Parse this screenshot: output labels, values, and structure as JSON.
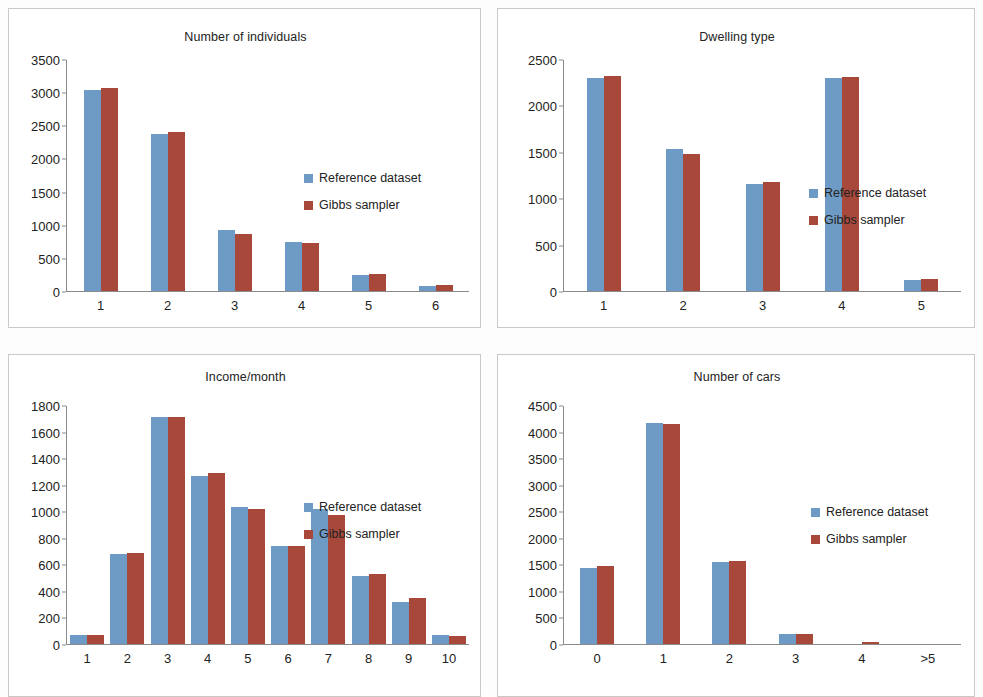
{
  "legend": {
    "series_a": "Reference dataset",
    "series_b": "Gibbs sampler"
  },
  "colors": {
    "series_a": "#6e9bc5",
    "series_b": "#a8483b",
    "axis": "#8a8a8a",
    "frame": "#c9c9c9",
    "text": "#222222",
    "background": "#ffffff"
  },
  "panels": [
    {
      "id": "number-of-individuals",
      "title": "Number of individuals"
    },
    {
      "id": "dwelling-type",
      "title": "Dwelling type"
    },
    {
      "id": "income-per-month",
      "title": "Income/month"
    },
    {
      "id": "number-of-cars",
      "title": "Number of cars"
    }
  ],
  "chart_data": [
    {
      "type": "bar",
      "title": "Number of individuals",
      "xlabel": "",
      "ylabel": "",
      "categories": [
        "1",
        "2",
        "3",
        "4",
        "5",
        "6"
      ],
      "yticks": [
        0,
        500,
        1000,
        1500,
        2000,
        2500,
        3000,
        3500
      ],
      "ylim": [
        0,
        3500
      ],
      "grid": false,
      "legend_position": "center-right",
      "series": [
        {
          "name": "Reference dataset",
          "values": [
            3040,
            2380,
            920,
            740,
            250,
            80
          ]
        },
        {
          "name": "Gibbs sampler",
          "values": [
            3070,
            2410,
            865,
            725,
            260,
            95
          ]
        }
      ]
    },
    {
      "type": "bar",
      "title": "Dwelling type",
      "xlabel": "",
      "ylabel": "",
      "categories": [
        "1",
        "2",
        "3",
        "4",
        "5"
      ],
      "yticks": [
        0,
        500,
        1000,
        1500,
        2000,
        2500
      ],
      "ylim": [
        0,
        2500
      ],
      "grid": false,
      "legend_position": "center-right",
      "series": [
        {
          "name": "Reference dataset",
          "values": [
            2300,
            1535,
            1155,
            2305,
            120
          ]
        },
        {
          "name": "Gibbs sampler",
          "values": [
            2325,
            1480,
            1180,
            2320,
            130
          ]
        }
      ]
    },
    {
      "type": "bar",
      "title": "Income/month",
      "xlabel": "",
      "ylabel": "",
      "categories": [
        "1",
        "2",
        "3",
        "4",
        "5",
        "6",
        "7",
        "8",
        "9",
        "10"
      ],
      "yticks": [
        0,
        200,
        400,
        600,
        800,
        1000,
        1200,
        1400,
        1600,
        1800
      ],
      "ylim": [
        0,
        1800
      ],
      "grid": false,
      "legend_position": "center-right",
      "series": [
        {
          "name": "Reference dataset",
          "values": [
            65,
            680,
            1715,
            1270,
            1040,
            745,
            1020,
            515,
            320,
            70
          ]
        },
        {
          "name": "Gibbs sampler",
          "values": [
            65,
            685,
            1715,
            1295,
            1020,
            740,
            975,
            530,
            345,
            60
          ]
        }
      ]
    },
    {
      "type": "bar",
      "title": "Number of cars",
      "xlabel": "",
      "ylabel": "",
      "categories": [
        "0",
        "1",
        "2",
        "3",
        "4",
        ">5"
      ],
      "yticks": [
        0,
        500,
        1000,
        1500,
        2000,
        2500,
        3000,
        3500,
        4000,
        4500
      ],
      "ylim": [
        0,
        4500
      ],
      "grid": false,
      "legend_position": "center-right",
      "series": [
        {
          "name": "Reference dataset",
          "values": [
            1430,
            4180,
            1560,
            180,
            0,
            0
          ]
        },
        {
          "name": "Gibbs sampler",
          "values": [
            1470,
            4165,
            1565,
            185,
            30,
            0
          ]
        }
      ]
    }
  ]
}
